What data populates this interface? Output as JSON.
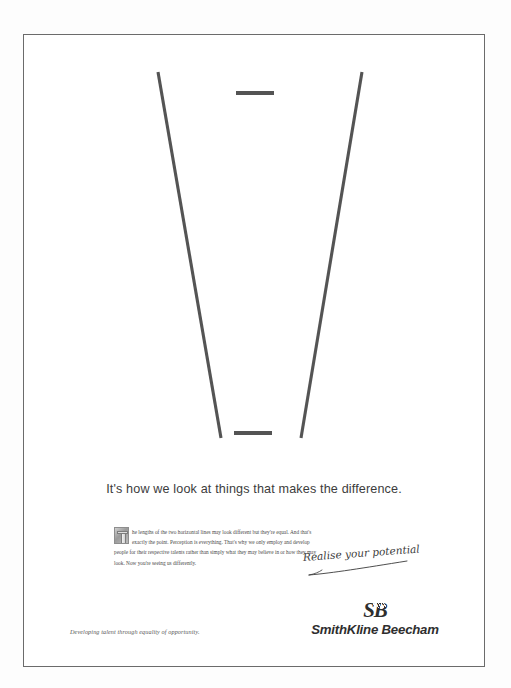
{
  "page": {
    "background_color": "#fdfdfd",
    "frame_color": "#6b6b6b",
    "ink_color": "#545454"
  },
  "figure": {
    "name": "ponzo-illusion",
    "line_color": "#545454",
    "top_bar_label": "upper horizontal line",
    "bottom_bar_label": "lower horizontal line",
    "left_rail_label": "left converging line",
    "right_rail_label": "right converging line"
  },
  "headline": {
    "text": "It's how we look at things that makes the difference."
  },
  "body_copy": {
    "dropcap": "T",
    "paragraph": "he lengths of the two horizontal lines may look different but they're equal. And that's exactly the point. Perception is everything. That's why we only employ and develop people for their respective talents rather than simply what they may believe in or how they may look. Now you're seeing us differently."
  },
  "strapline": {
    "text": "Realise your potential"
  },
  "logo": {
    "monogram": "SB",
    "wordmark": "SmithKline Beecham"
  },
  "footer": {
    "tagline": "Developing talent through equality of opportunity."
  }
}
